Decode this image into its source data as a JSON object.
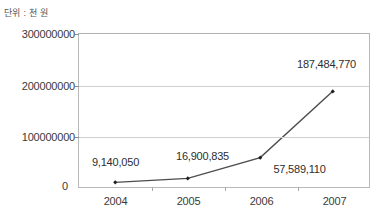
{
  "unit_label": "단위 : 천 원",
  "clipped_caption": "",
  "zero_label": "0",
  "chart_data": {
    "type": "line",
    "title": "",
    "xlabel": "",
    "ylabel": "",
    "categories": [
      "2004",
      "2005",
      "2006",
      "2007"
    ],
    "values": [
      9140050,
      16900835,
      57589110,
      187484770
    ],
    "point_labels": [
      "9,140,050",
      "16,900,835",
      "57,589,110",
      "187,484,770"
    ],
    "ytick_labels": [
      "300000000",
      "200000000",
      "100000000"
    ],
    "ytick_values": [
      300000000,
      200000000,
      100000000
    ],
    "ylim": [
      0,
      300000000
    ],
    "grid": true,
    "legend": "none",
    "series_color": "#4d4d4d",
    "marker_color": "#1f1f1f",
    "grid_color": "#cfcfcf",
    "frame_color": "#b9b9b9"
  }
}
